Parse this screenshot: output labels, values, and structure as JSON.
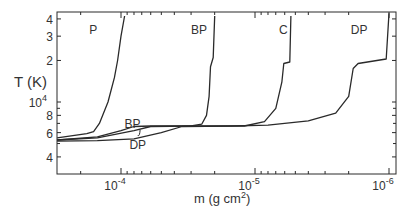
{
  "chart_data": {
    "type": "line",
    "title": "",
    "xlabel": "m (g cm²)",
    "xlabel_parts": {
      "base": "m  (g  cm",
      "sup": "2",
      "tail": ")"
    },
    "ylabel": "T (K)",
    "x_scale": "log",
    "x_reversed": true,
    "xlim": [
      0.0003,
      9e-07
    ],
    "y_scale": "log",
    "ylim": [
      3300,
      45000
    ],
    "grid": false,
    "legend": "inline curve labels",
    "x_major_ticks": [
      {
        "value": 0.0001,
        "label": "10",
        "exp": "-4"
      },
      {
        "value": 1e-05,
        "label": "10",
        "exp": "-5"
      },
      {
        "value": 1e-06,
        "label": "10",
        "exp": "-6"
      }
    ],
    "y_ticks": [
      {
        "value": 40000,
        "label": "4"
      },
      {
        "value": 30000,
        "label": "3"
      },
      {
        "value": 20000,
        "label": "2"
      },
      {
        "value": 10000,
        "label": "10",
        "exp": "4"
      },
      {
        "value": 8000,
        "label": "8"
      },
      {
        "value": 6000,
        "label": "6"
      },
      {
        "value": 4000,
        "label": "4"
      }
    ],
    "series": [
      {
        "name": "P",
        "label_pos": {
          "m": 0.000145,
          "T": 34000
        },
        "points": [
          [
            0.0003,
            5500
          ],
          [
            0.00018,
            5900
          ],
          [
            0.00016,
            6100
          ],
          [
            0.000145,
            7000
          ],
          [
            0.000125,
            10000
          ],
          [
            0.000112,
            15000
          ],
          [
            0.000106,
            20000
          ],
          [
            0.0001,
            30000
          ],
          [
            9.4e-05,
            42000
          ]
        ]
      },
      {
        "name": "BP",
        "label_pos": {
          "m": 2.2e-05,
          "T": 34000
        },
        "alt_label_pos": {
          "m": 8.2e-05,
          "T": 7100
        },
        "points": [
          [
            0.0003,
            5300
          ],
          [
            0.00015,
            5600
          ],
          [
            0.0001,
            6200
          ],
          [
            8e-05,
            6650
          ],
          [
            6e-05,
            6700
          ],
          [
            3e-05,
            6700
          ],
          [
            2.5e-05,
            6900
          ],
          [
            2.3e-05,
            8000
          ],
          [
            2.2e-05,
            11000
          ],
          [
            2.15e-05,
            18000
          ],
          [
            2.05e-05,
            21000
          ],
          [
            2e-05,
            42000
          ]
        ]
      },
      {
        "name": "C",
        "label_pos": {
          "m": 5.5e-06,
          "T": 34000
        },
        "points": [
          [
            0.0003,
            5300
          ],
          [
            0.00015,
            5500
          ],
          [
            8e-05,
            6200
          ],
          [
            6e-05,
            6650
          ],
          [
            3e-05,
            6700
          ],
          [
            1.2e-05,
            6700
          ],
          [
            8.5e-06,
            7200
          ],
          [
            7e-06,
            9000
          ],
          [
            6.3e-06,
            14000
          ],
          [
            6.1e-06,
            19000
          ],
          [
            5.5e-06,
            19500
          ],
          [
            5.4e-06,
            42000
          ]
        ]
      },
      {
        "name": "DP",
        "label_pos": {
          "m": 1.4e-06,
          "T": 34000
        },
        "alt_label_pos": {
          "m": 7.5e-05,
          "T": 5000
        },
        "points": [
          [
            0.0003,
            5200
          ],
          [
            0.00015,
            5250
          ],
          [
            8e-05,
            5400
          ],
          [
            5e-05,
            6000
          ],
          [
            3.5e-05,
            6650
          ],
          [
            1.5e-05,
            6700
          ],
          [
            8e-06,
            6800
          ],
          [
            4e-06,
            7300
          ],
          [
            2.5e-06,
            8300
          ],
          [
            2e-06,
            11000
          ],
          [
            1.85e-06,
            17500
          ],
          [
            1.7e-06,
            19000
          ],
          [
            1.05e-06,
            20500
          ],
          [
            1e-06,
            44000
          ]
        ]
      }
    ]
  }
}
